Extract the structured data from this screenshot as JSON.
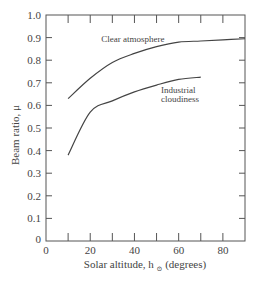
{
  "chart_data": {
    "type": "line",
    "title": "",
    "xlabel": "Solar altitude, h",
    "xlabel_subscript": "⊙",
    "xlabel_suffix": " (degrees)",
    "ylabel": "Beam ratio, μ",
    "xlim": [
      0,
      90
    ],
    "ylim": [
      0,
      1.0
    ],
    "x_ticks": [
      0,
      20,
      40,
      60,
      80
    ],
    "x_minor_ticks": [
      10,
      30,
      50,
      70
    ],
    "y_ticks": [
      "0",
      "0.1",
      "0.2",
      "0.3",
      "0.4",
      "0.5",
      "0.6",
      "0.7",
      "0.8",
      "0.9",
      "1.0"
    ],
    "grid": false,
    "legend": "inline annotations",
    "series": [
      {
        "name": "Clear atmosphere",
        "x": [
          10,
          20,
          30,
          40,
          50,
          60,
          70,
          80,
          90
        ],
        "values": [
          0.63,
          0.72,
          0.79,
          0.83,
          0.86,
          0.88,
          0.885,
          0.89,
          0.895
        ]
      },
      {
        "name": "Industrial cloudiness",
        "x": [
          10,
          20,
          30,
          40,
          50,
          60,
          70
        ],
        "values": [
          0.38,
          0.57,
          0.62,
          0.66,
          0.69,
          0.715,
          0.725
        ]
      }
    ],
    "annotations": [
      {
        "text": "Clear atmosphere",
        "x": 25,
        "y": 0.88
      },
      {
        "text": "Industrial",
        "x": 52,
        "y": 0.655
      },
      {
        "text": "cloudiness",
        "x": 52,
        "y": 0.615
      }
    ]
  }
}
